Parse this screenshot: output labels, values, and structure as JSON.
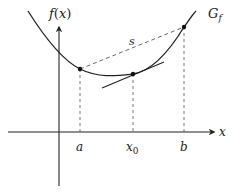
{
  "diagram": {
    "colors": {
      "stroke": "#222222",
      "dashed": "#555555",
      "background": "#ffffff"
    },
    "axes": {
      "y_label": "f(x)",
      "y_label_func": "f",
      "y_label_open": "(",
      "y_label_var": "x",
      "y_label_close": ")",
      "x_label": "x"
    },
    "curve": {
      "label_main": "G",
      "label_sub": "f"
    },
    "secant": {
      "label": "s"
    },
    "points": {
      "a": {
        "label": "a"
      },
      "x0": {
        "label_main": "x",
        "label_sub": "0"
      },
      "b": {
        "label": "b"
      }
    }
  }
}
